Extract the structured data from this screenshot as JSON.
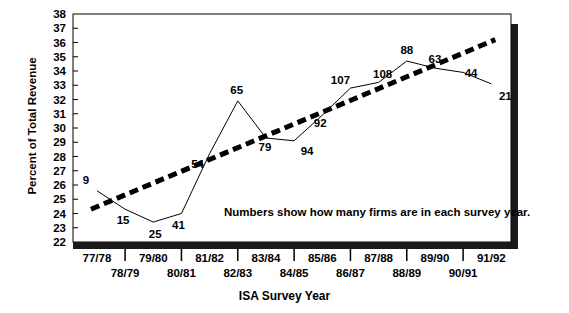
{
  "chart_data": {
    "type": "line",
    "title": "",
    "xlabel": "ISA Survey Year",
    "ylabel": "Percent of Total Revenue",
    "ylim": [
      22,
      38
    ],
    "yticks": [
      38,
      37,
      36,
      35,
      34,
      33,
      32,
      31,
      30,
      29,
      28,
      27,
      26,
      25,
      24,
      23,
      22
    ],
    "categories": [
      "77/78",
      "78/79",
      "79/80",
      "80/81",
      "81/82",
      "82/83",
      "83/84",
      "84/85",
      "85/86",
      "86/87",
      "87/88",
      "88/89",
      "89/90",
      "90/91",
      "91/92"
    ],
    "grid": false,
    "legend": null,
    "annotation": "Numbers show how many firms are in each survey year.",
    "series": [
      {
        "name": "Percent of Total Revenue",
        "style": "solid-thin",
        "values": [
          25.6,
          24.3,
          23.4,
          24.0,
          28.2,
          31.9,
          29.3,
          29.1,
          30.9,
          32.8,
          33.2,
          34.7,
          34.2,
          33.9,
          33.1
        ],
        "point_labels": [
          "9",
          "15",
          "25",
          "41",
          "54",
          "65",
          "79",
          "94",
          "92",
          "107",
          "108",
          "88",
          "63",
          "44",
          "21"
        ]
      },
      {
        "name": "Trend line",
        "style": "dashed-thick",
        "x_range": [
          "77/78",
          "91/92"
        ],
        "y_range": [
          24.3,
          36.2
        ]
      }
    ]
  }
}
